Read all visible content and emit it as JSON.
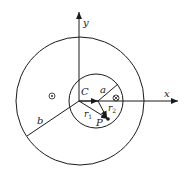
{
  "diagram": {
    "type": "coaxial-cylinder-cross-section",
    "labels": {
      "x_axis": "x",
      "y_axis": "y",
      "center": "C",
      "inner_radius": "a",
      "outer_radius": "b",
      "r1": "r",
      "r1_sub": "1",
      "r2": "r",
      "r2_sub": "2",
      "point": "P"
    },
    "symbols": {
      "out_of_page": "dot-in-circle",
      "into_page": "cross-in-circle"
    },
    "colors": {
      "stroke": "#1a1a1a",
      "background": "#ffffff"
    }
  }
}
